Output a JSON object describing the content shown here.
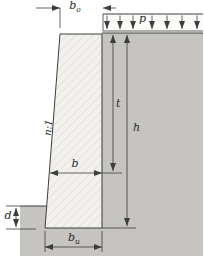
{
  "diagram": {
    "name": "gravity-retaining-wall-cross-section",
    "labels": {
      "top_width": {
        "base": "b",
        "sub": "o"
      },
      "surcharge": "p",
      "slope": "n:1",
      "depth_t": "t",
      "height_h": "h",
      "mid_width": "b",
      "embedment": "d",
      "base_width": {
        "base": "b",
        "sub": "u"
      }
    },
    "colors": {
      "soil": "#c5c4c1",
      "wall_fill": "#f2f1ee",
      "load_strip": "#fbfbfa",
      "line": "#3d3d3b",
      "text": "#2b2b29",
      "background": "#ffffff"
    }
  }
}
